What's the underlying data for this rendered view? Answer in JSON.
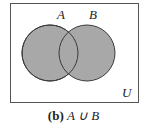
{
  "diagram": {
    "universe_label": "U",
    "set_a_label": "A",
    "set_b_label": "B",
    "shaded_region": "A ∪ B",
    "fill_color": "#a8a8a8",
    "stroke_color": "#3a3a3a"
  },
  "caption": {
    "tag": "(b)",
    "expression": "A ∪ B"
  }
}
